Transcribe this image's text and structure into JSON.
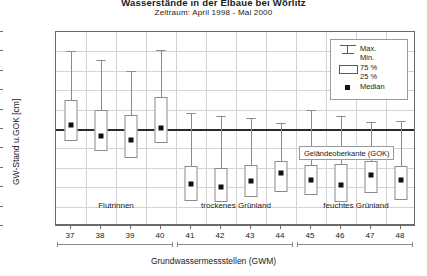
{
  "title": "Wasserstände in der Elbaue bei Wörlitz",
  "subtitle": "Zeitraum: April 1998 - Mai 2000",
  "axes": {
    "ylabel": "GW-Stand u.GOK [cm]",
    "xlabel": "Grundwassermessstellen (GWM)",
    "yticks": [
      "-500",
      "-400",
      "-300",
      "-200",
      "-100",
      "0",
      "100",
      "200",
      "300",
      "400",
      "500"
    ]
  },
  "annotation": {
    "gok_label": "Geländeoberkante (GOK)"
  },
  "legend": {
    "max_label": "Max.",
    "min_label": "Min.",
    "p75_label": "75 %",
    "p25_label": "25 %",
    "median_label": "Median"
  },
  "groups": [
    {
      "label": "Flutrinnen",
      "from": 37,
      "to": 40
    },
    {
      "label": "trockenes Grünland",
      "from": 41,
      "to": 44
    },
    {
      "label": "feuchtes Grünland",
      "from": 45,
      "to": 48
    }
  ],
  "chart_data": {
    "type": "boxplot",
    "title": "Wasserstände in der Elbaue bei Wörlitz",
    "subtitle": "Zeitraum: April 1998 - Mai 2000",
    "xlabel": "Grundwassermessstellen (GWM)",
    "ylabel": "GW-Stand u.GOK [cm]",
    "ylim": [
      -500,
      500
    ],
    "y_inverted": true,
    "grid": true,
    "legend_position": "top-right",
    "categories": [
      "37",
      "38",
      "39",
      "40",
      "41",
      "42",
      "43",
      "44",
      "45",
      "46",
      "47",
      "48"
    ],
    "boxes": [
      {
        "category": "37",
        "group": "Flutrinnen",
        "min": -400,
        "p25": 60,
        "median": -20,
        "p75": -150,
        "max": -400
      },
      {
        "category": "38",
        "group": "Flutrinnen",
        "min": -355,
        "p25": 115,
        "median": 35,
        "p75": -100,
        "max": -355
      },
      {
        "category": "39",
        "group": "Flutrinnen",
        "min": -300,
        "p25": 150,
        "median": 55,
        "p75": -70,
        "max": -300
      },
      {
        "category": "40",
        "group": "Flutrinnen",
        "min": -405,
        "p25": 70,
        "median": -5,
        "p75": -165,
        "max": -405
      },
      {
        "category": "41",
        "group": "trockenes Grünland",
        "min": -85,
        "p25": 370,
        "median": 285,
        "p75": 190,
        "max": -85
      },
      {
        "category": "42",
        "group": "trockenes Grünland",
        "min": -65,
        "p25": 375,
        "median": 300,
        "p75": 200,
        "max": -65
      },
      {
        "category": "43",
        "group": "trockenes Grünland",
        "min": -55,
        "p25": 350,
        "median": 270,
        "p75": 185,
        "max": -55
      },
      {
        "category": "44",
        "group": "trockenes Grünland",
        "min": -30,
        "p25": 325,
        "median": 225,
        "p75": 165,
        "max": -30
      },
      {
        "category": "45",
        "group": "feuchtes Grünland",
        "min": -100,
        "p25": 340,
        "median": 265,
        "p75": 185,
        "max": -100
      },
      {
        "category": "46",
        "group": "feuchtes Grünland",
        "min": -65,
        "p25": 375,
        "median": 290,
        "p75": 180,
        "max": -65
      },
      {
        "category": "47",
        "group": "feuchtes Grünland",
        "min": -35,
        "p25": 330,
        "median": 235,
        "p75": 165,
        "max": -35
      },
      {
        "category": "48",
        "group": "feuchtes Grünland",
        "min": -40,
        "p25": 365,
        "median": 265,
        "p75": 190,
        "max": -40
      }
    ]
  }
}
